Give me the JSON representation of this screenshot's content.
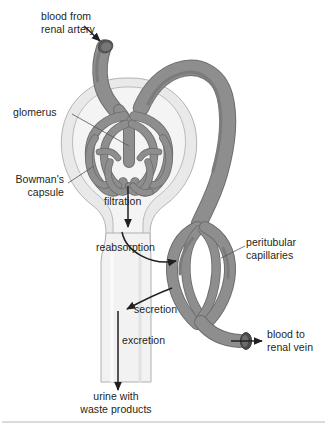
{
  "figure": {
    "labels": {
      "blood_from_renal_artery": "blood from\nrenal artery",
      "glomerus": "glomerus",
      "bowmans_capsule": "Bowman's\ncapsule",
      "filtration": "filtration",
      "reabsorption": "reabsorption",
      "peritubular_capillaries": "peritubular\ncapillaries",
      "secretion": "secretion",
      "excretion": "excretion",
      "blood_to_renal_vein": "blood to\nrenal vein",
      "urine_with_waste_products": "urine with\nwaste products"
    },
    "colors": {
      "background": "#ffffff",
      "text": "#231f20",
      "vessel_fill": "#8e8e8e",
      "vessel_stroke": "#6e6e6e",
      "vessel_shade": "#7d7d7d",
      "vessel_opening": "#4a4a4a",
      "capsule_outer_fill": "#e9e9e9",
      "capsule_inner_fill": "#f3f3f3",
      "capsule_stroke": "#b4b4b4",
      "tubule_fill": "#f2f2f2",
      "tubule_stroke": "#b0b0b0",
      "arrow": "#231f20",
      "leader_line": "#555555",
      "footer_rule": "#b8b8b8"
    }
  }
}
